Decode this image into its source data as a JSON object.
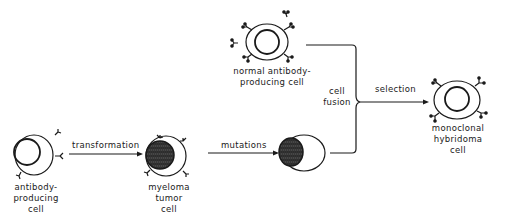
{
  "diagram": {
    "nodes": [
      {
        "id": "antibody_producing_cell",
        "label_lines": [
          "antibody-",
          "producing",
          "cell"
        ]
      },
      {
        "id": "myeloma_tumor_cell",
        "label_lines": [
          "myeloma",
          "tumor",
          "cell"
        ]
      },
      {
        "id": "mutated_myeloma_cell",
        "label_lines": []
      },
      {
        "id": "normal_antibody_producing_cell",
        "label_lines": [
          "normal antibody-",
          "producing cell"
        ]
      },
      {
        "id": "monoclonal_hybridoma_cell",
        "label_lines": [
          "monoclonal",
          "hybridoma",
          "cell"
        ]
      }
    ],
    "edges": [
      {
        "from": "antibody_producing_cell",
        "to": "myeloma_tumor_cell",
        "label": "transformation"
      },
      {
        "from": "myeloma_tumor_cell",
        "to": "mutated_myeloma_cell",
        "label": "mutations"
      },
      {
        "from": "mutated_myeloma_cell",
        "to": "cell_fusion",
        "label": ""
      },
      {
        "from": "normal_antibody_producing_cell",
        "to": "cell_fusion",
        "label": ""
      },
      {
        "from": "cell_fusion",
        "to": "monoclonal_hybridoma_cell",
        "label": "selection"
      }
    ],
    "junction": {
      "label_lines": [
        "cell",
        "fusion"
      ]
    }
  }
}
